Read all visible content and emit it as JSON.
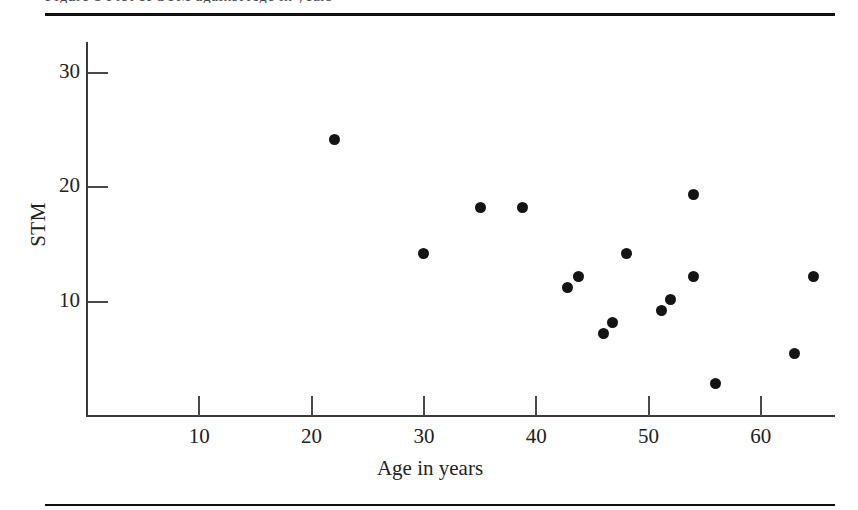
{
  "figure": {
    "clipped_title_remnant": "Figure 1  Plot of STM against Age in years",
    "rules": {
      "top": "horizontal-rule",
      "bottom": "horizontal-rule"
    }
  },
  "chart_data": {
    "type": "scatter",
    "title": "",
    "xlabel": "Age in years",
    "ylabel": "STM",
    "xlim": [
      0,
      66.7
    ],
    "ylim": [
      0,
      32.8
    ],
    "grid": false,
    "legend": null,
    "xticks": [
      10,
      20,
      30,
      40,
      50,
      60
    ],
    "xtick_labels": [
      "10",
      "20",
      "30",
      "40",
      "50",
      "60"
    ],
    "yticks": [
      10,
      20,
      30
    ],
    "ytick_labels": [
      "10",
      "20",
      "30"
    ],
    "marker": "filled-circle",
    "marker_color": "#141414",
    "marker_size_px": 11,
    "n_points": 16,
    "x": [
      22.0,
      30.0,
      35.0,
      38.8,
      42.8,
      43.8,
      46.0,
      46.8,
      48.0,
      51.2,
      52.0,
      54.0,
      54.0,
      56.0,
      63.0,
      64.7
    ],
    "y": [
      24.2,
      14.2,
      18.2,
      18.2,
      11.2,
      12.2,
      7.2,
      8.2,
      14.2,
      9.2,
      10.2,
      12.2,
      19.4,
      2.8,
      5.5,
      12.2
    ],
    "points": [
      {
        "x": 22.0,
        "y": 24.2
      },
      {
        "x": 30.0,
        "y": 14.2
      },
      {
        "x": 35.0,
        "y": 18.2
      },
      {
        "x": 38.8,
        "y": 18.2
      },
      {
        "x": 42.8,
        "y": 11.2
      },
      {
        "x": 43.8,
        "y": 12.2
      },
      {
        "x": 46.0,
        "y": 7.2
      },
      {
        "x": 46.8,
        "y": 8.2
      },
      {
        "x": 48.0,
        "y": 14.2
      },
      {
        "x": 51.2,
        "y": 9.2
      },
      {
        "x": 52.0,
        "y": 10.2
      },
      {
        "x": 54.0,
        "y": 12.2
      },
      {
        "x": 54.0,
        "y": 19.4
      },
      {
        "x": 56.0,
        "y": 2.8
      },
      {
        "x": 63.0,
        "y": 5.5
      },
      {
        "x": 64.7,
        "y": 12.2
      }
    ]
  },
  "colors": {
    "marker": "#141414",
    "axis": "#3a3a3a",
    "text": "#222222",
    "rule": "#111111",
    "background": "#ffffff"
  }
}
